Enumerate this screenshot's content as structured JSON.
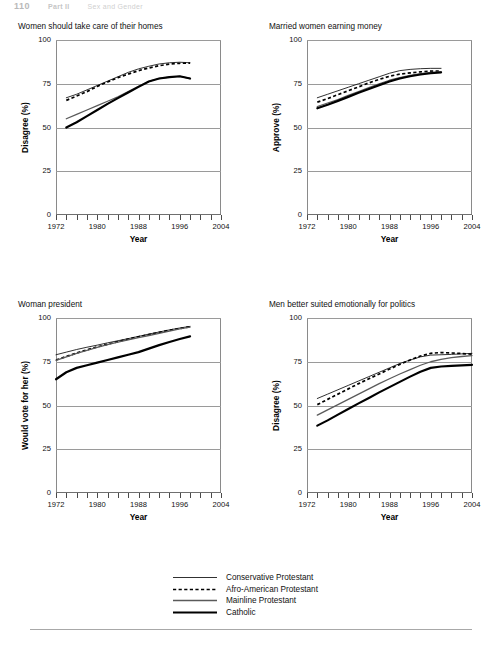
{
  "running_header": {
    "page_number": "110",
    "part": "Part II",
    "section": "Sex and Gender"
  },
  "axis": {
    "x_title": "Year",
    "x_ticks": [
      1972,
      1974,
      1976,
      1978,
      1980,
      1982,
      1984,
      1986,
      1988,
      1990,
      1992,
      1994,
      1996,
      1998,
      2000,
      2002,
      2004
    ],
    "x_labels": [
      "1972",
      "1980",
      "1988",
      "1996",
      "2004"
    ],
    "x_label_values": [
      1972,
      1980,
      1988,
      1996,
      2004
    ],
    "y_labels": [
      "0",
      "25",
      "50",
      "75",
      "100"
    ],
    "y_values": [
      0,
      25,
      50,
      75,
      100
    ],
    "xlim": [
      1972,
      2004
    ],
    "ylim": [
      0,
      100
    ]
  },
  "legend": {
    "position": "bottom-center",
    "entries": [
      {
        "label": "Conservative Protestant",
        "style": "thin-solid",
        "color": "#1a1a1a",
        "width": 0.9,
        "dash": ""
      },
      {
        "label": "Afro-American Protestant",
        "style": "dotted",
        "color": "#000000",
        "width": 1.7,
        "dash": "3.2,2.4"
      },
      {
        "label": "Mainline Protestant",
        "style": "medium-solid",
        "color": "#5a5a5a",
        "width": 1.3,
        "dash": ""
      },
      {
        "label": "Catholic",
        "style": "thick-solid",
        "color": "#000000",
        "width": 2.2,
        "dash": ""
      }
    ]
  },
  "caption": "",
  "chart_data": [
    {
      "id": "panel-1",
      "type": "line",
      "title": "Women should take care of their homes",
      "xlabel": "Year",
      "ylabel": "Disagree (%)",
      "xlim": [
        1972,
        2004
      ],
      "ylim": [
        0,
        100
      ],
      "grid": true,
      "series": [
        {
          "name": "Conservative Protestant",
          "x": [
            1974,
            1976,
            1978,
            1980,
            1982,
            1984,
            1986,
            1988,
            1990,
            1992,
            1994,
            1996,
            1998
          ],
          "y": [
            67.0,
            69.0,
            71.5,
            74.0,
            76.5,
            79.0,
            81.5,
            83.5,
            85.0,
            86.3,
            87.0,
            87.3,
            87.0
          ]
        },
        {
          "name": "Afro-American Protestant",
          "x": [
            1974,
            1976,
            1978,
            1980,
            1982,
            1984,
            1986,
            1988,
            1990,
            1992,
            1994,
            1996,
            1998
          ],
          "y": [
            65.5,
            68.0,
            70.5,
            73.5,
            76.0,
            78.5,
            80.5,
            82.5,
            84.0,
            85.3,
            86.2,
            86.7,
            86.8
          ]
        },
        {
          "name": "Mainline Protestant",
          "x": [
            1974,
            1976,
            1978,
            1980,
            1982,
            1984,
            1986,
            1988,
            1990,
            1992,
            1994,
            1996,
            1998
          ],
          "y": [
            55.0,
            57.5,
            60.0,
            62.5,
            65.0,
            67.5,
            70.5,
            73.5,
            76.3,
            78.0,
            78.8,
            79.2,
            78.0
          ]
        },
        {
          "name": "Catholic",
          "x": [
            1974,
            1976,
            1978,
            1980,
            1982,
            1984,
            1986,
            1988,
            1990,
            1992,
            1994,
            1996,
            1998
          ],
          "y": [
            50.0,
            53.0,
            56.5,
            60.0,
            63.5,
            66.8,
            70.0,
            73.2,
            76.3,
            78.0,
            78.8,
            79.3,
            78.0
          ]
        }
      ]
    },
    {
      "id": "panel-2",
      "type": "line",
      "title": "Married women earning money",
      "xlabel": "Year",
      "ylabel": "Approve (%)",
      "xlim": [
        1972,
        2004
      ],
      "ylim": [
        0,
        100
      ],
      "grid": true,
      "series": [
        {
          "name": "Conservative Protestant",
          "x": [
            1974,
            1976,
            1978,
            1980,
            1982,
            1984,
            1986,
            1988,
            1990,
            1992,
            1994,
            1996,
            1998
          ],
          "y": [
            67.0,
            69.0,
            71.0,
            73.0,
            75.0,
            77.0,
            79.0,
            81.0,
            82.5,
            83.2,
            83.6,
            83.8,
            83.8
          ]
        },
        {
          "name": "Afro-American Protestant",
          "x": [
            1974,
            1976,
            1978,
            1980,
            1982,
            1984,
            1986,
            1988,
            1990,
            1992,
            1994,
            1996,
            1998
          ],
          "y": [
            64.5,
            66.5,
            68.8,
            71.0,
            73.2,
            75.5,
            77.5,
            79.3,
            80.5,
            81.2,
            81.8,
            82.2,
            82.3
          ]
        },
        {
          "name": "Mainline Protestant",
          "x": [
            1974,
            1976,
            1978,
            1980,
            1982,
            1984,
            1986,
            1988,
            1990,
            1992,
            1994,
            1996,
            1998
          ],
          "y": [
            62.0,
            64.0,
            66.0,
            68.3,
            70.5,
            72.8,
            75.0,
            77.0,
            78.5,
            79.8,
            80.8,
            81.5,
            81.8
          ]
        },
        {
          "name": "Catholic",
          "x": [
            1974,
            1976,
            1978,
            1980,
            1982,
            1984,
            1986,
            1988,
            1990,
            1992,
            1994,
            1996,
            1998
          ],
          "y": [
            61.0,
            63.0,
            65.2,
            67.5,
            69.8,
            72.0,
            74.2,
            76.3,
            78.0,
            79.3,
            80.3,
            81.0,
            81.5
          ]
        }
      ]
    },
    {
      "id": "panel-3",
      "type": "line",
      "title": "Woman president",
      "xlabel": "Year",
      "ylabel": "Would vote for her (%)",
      "xlim": [
        1972,
        2004
      ],
      "ylim": [
        0,
        100
      ],
      "grid": true,
      "series": [
        {
          "name": "Conservative Protestant",
          "x": [
            1972,
            1974,
            1976,
            1978,
            1980,
            1982,
            1984,
            1986,
            1988,
            1990,
            1992,
            1994,
            1996,
            1998
          ],
          "y": [
            79.0,
            80.5,
            82.0,
            83.3,
            84.5,
            85.8,
            87.0,
            88.2,
            89.5,
            90.8,
            92.0,
            93.2,
            94.3,
            95.2
          ]
        },
        {
          "name": "Afro-American Protestant",
          "x": [
            1972,
            1974,
            1976,
            1978,
            1980,
            1982,
            1984,
            1986,
            1988,
            1990,
            1992,
            1994,
            1996,
            1998
          ],
          "y": [
            76.0,
            78.0,
            80.0,
            81.8,
            83.5,
            85.0,
            86.5,
            88.0,
            89.3,
            90.5,
            91.8,
            93.0,
            94.0,
            95.0
          ]
        },
        {
          "name": "Mainline Protestant",
          "x": [
            1972,
            1974,
            1976,
            1978,
            1980,
            1982,
            1984,
            1986,
            1988,
            1990,
            1992,
            1994,
            1996,
            1998
          ],
          "y": [
            75.8,
            77.8,
            79.8,
            81.5,
            83.2,
            84.8,
            86.2,
            87.5,
            88.8,
            90.0,
            91.2,
            92.5,
            93.8,
            94.8
          ]
        },
        {
          "name": "Catholic",
          "x": [
            1972,
            1974,
            1976,
            1978,
            1980,
            1982,
            1984,
            1986,
            1988,
            1990,
            1992,
            1994,
            1996,
            1998
          ],
          "y": [
            65.0,
            69.0,
            71.5,
            73.0,
            74.5,
            76.0,
            77.5,
            79.0,
            80.5,
            82.5,
            84.5,
            86.3,
            88.0,
            89.5
          ]
        }
      ]
    },
    {
      "id": "panel-4",
      "type": "line",
      "title": "Men better suited emotionally for politics",
      "xlabel": "Year",
      "ylabel": "Disagree (%)",
      "xlim": [
        1972,
        2004
      ],
      "ylim": [
        0,
        100
      ],
      "grid": true,
      "series": [
        {
          "name": "Conservative Protestant",
          "x": [
            1974,
            1976,
            1978,
            1980,
            1982,
            1984,
            1986,
            1988,
            1990,
            1992,
            1994,
            1996,
            1998,
            2000,
            2002,
            2004
          ],
          "y": [
            54.0,
            56.5,
            59.0,
            61.5,
            64.0,
            66.5,
            69.0,
            71.5,
            74.0,
            76.0,
            77.8,
            78.8,
            79.0,
            79.2,
            79.5,
            79.8
          ]
        },
        {
          "name": "Afro-American Protestant",
          "x": [
            1974,
            1976,
            1978,
            1980,
            1982,
            1984,
            1986,
            1988,
            1990,
            1992,
            1994,
            1996,
            1998,
            2000,
            2002,
            2004
          ],
          "y": [
            50.5,
            53.5,
            56.5,
            59.5,
            62.5,
            65.3,
            68.0,
            70.8,
            73.5,
            76.0,
            78.3,
            79.8,
            80.3,
            80.0,
            79.7,
            79.3
          ]
        },
        {
          "name": "Mainline Protestant",
          "x": [
            1974,
            1976,
            1978,
            1980,
            1982,
            1984,
            1986,
            1988,
            1990,
            1992,
            1994,
            1996,
            1998,
            2000,
            2002,
            2004
          ],
          "y": [
            44.5,
            47.5,
            50.5,
            53.5,
            56.5,
            59.5,
            62.5,
            65.3,
            68.0,
            70.5,
            73.0,
            75.0,
            76.3,
            77.3,
            78.0,
            78.5
          ]
        },
        {
          "name": "Catholic",
          "x": [
            1974,
            1976,
            1978,
            1980,
            1982,
            1984,
            1986,
            1988,
            1990,
            1992,
            1994,
            1996,
            1998,
            2000,
            2002,
            2004
          ],
          "y": [
            38.5,
            41.5,
            44.8,
            48.0,
            51.2,
            54.3,
            57.5,
            60.5,
            63.5,
            66.5,
            69.3,
            71.5,
            72.3,
            72.6,
            72.9,
            73.2
          ]
        }
      ]
    }
  ]
}
